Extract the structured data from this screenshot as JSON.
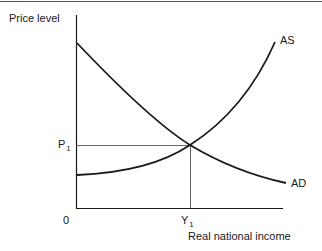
{
  "diagram": {
    "y_axis_label": "Price level",
    "x_axis_label": "Real national income",
    "origin_label": "0",
    "price_label": {
      "main": "P",
      "sub": "1"
    },
    "income_label": {
      "main": "Y",
      "sub": "1"
    },
    "curves": [
      {
        "name": "AS",
        "label": "AS"
      },
      {
        "name": "AD",
        "label": "AD"
      }
    ],
    "colors": {
      "line": "#1a1a1a",
      "guide": "#555555",
      "background": "#ffffff"
    }
  }
}
